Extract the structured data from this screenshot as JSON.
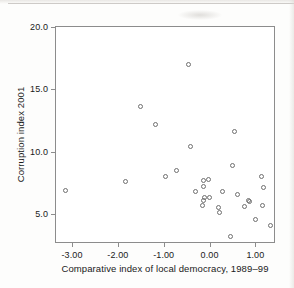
{
  "chart_data": {
    "type": "scatter",
    "title": "",
    "xlabel": "Comparative index of local democracy, 1989–99",
    "ylabel": "Corruption index 2001",
    "xlim": [
      -3.35,
      1.45
    ],
    "ylim": [
      2.6,
      20.0
    ],
    "grid": false,
    "legend": null,
    "xticks": [
      -3.0,
      -2.0,
      -1.0,
      0.0,
      1.0
    ],
    "xtick_labels": [
      "-3.00",
      "-2.00",
      "-1.00",
      "0.00",
      "1.00"
    ],
    "yticks": [
      5.0,
      10.0,
      15.0,
      20.0
    ],
    "ytick_labels": [
      "5.0",
      "10.0",
      "15.0",
      "20.0"
    ],
    "marker": "open-circle",
    "marker_color": "#6f6f6f",
    "points": [
      {
        "x": -3.15,
        "y": 6.9
      },
      {
        "x": -1.83,
        "y": 7.6
      },
      {
        "x": -1.5,
        "y": 13.6
      },
      {
        "x": -1.17,
        "y": 12.2
      },
      {
        "x": -0.96,
        "y": 8.0
      },
      {
        "x": -0.73,
        "y": 8.5
      },
      {
        "x": -0.45,
        "y": 17.0
      },
      {
        "x": -0.42,
        "y": 10.4
      },
      {
        "x": -0.3,
        "y": 6.8
      },
      {
        "x": -0.13,
        "y": 7.7
      },
      {
        "x": -0.13,
        "y": 7.2
      },
      {
        "x": -0.11,
        "y": 6.3
      },
      {
        "x": -0.13,
        "y": 6.1
      },
      {
        "x": -0.15,
        "y": 5.7
      },
      {
        "x": -0.02,
        "y": 7.8
      },
      {
        "x": 0.0,
        "y": 6.3
      },
      {
        "x": 0.19,
        "y": 5.5
      },
      {
        "x": 0.22,
        "y": 5.1
      },
      {
        "x": 0.28,
        "y": 6.8
      },
      {
        "x": 0.45,
        "y": 3.2
      },
      {
        "x": 0.5,
        "y": 8.9
      },
      {
        "x": 0.55,
        "y": 11.6
      },
      {
        "x": 0.62,
        "y": 6.6
      },
      {
        "x": 0.76,
        "y": 5.6
      },
      {
        "x": 0.85,
        "y": 6.1
      },
      {
        "x": 0.88,
        "y": 6.0
      },
      {
        "x": 1.0,
        "y": 4.6
      },
      {
        "x": 1.13,
        "y": 8.0
      },
      {
        "x": 1.15,
        "y": 5.7
      },
      {
        "x": 1.17,
        "y": 7.1
      },
      {
        "x": 1.32,
        "y": 4.1
      }
    ]
  }
}
